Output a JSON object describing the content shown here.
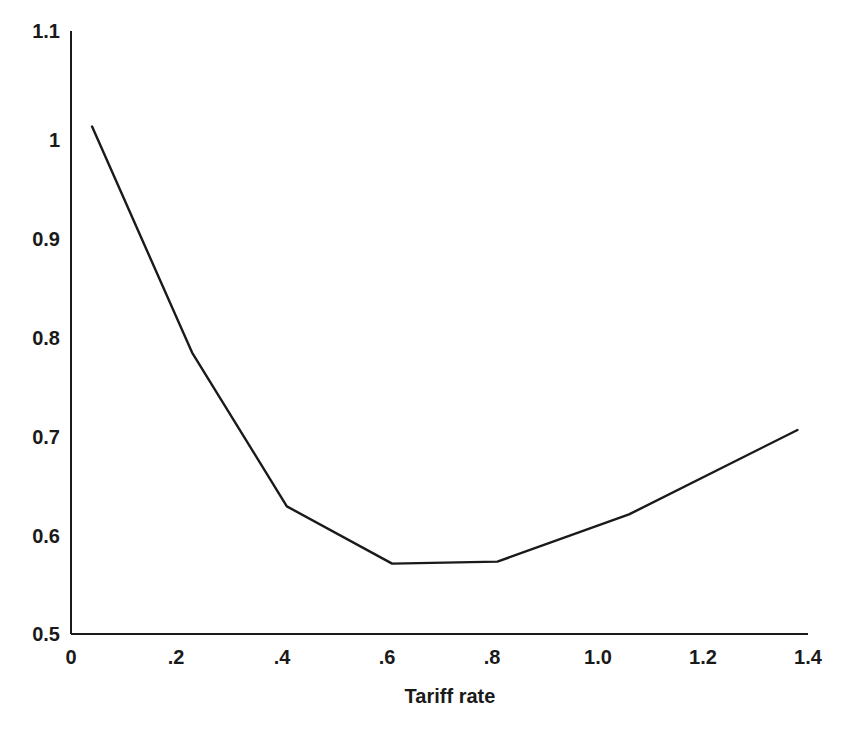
{
  "chart_data": {
    "type": "line",
    "title": "",
    "subtitle": "",
    "xlabel": "Tariff rate",
    "ylabel": "",
    "xlim": [
      0,
      1.4
    ],
    "ylim": [
      0.5,
      1.1
    ],
    "grid": false,
    "legend": null,
    "annotations": [],
    "x_ticks": [
      {
        "value": 0,
        "label": "0"
      },
      {
        "value": 0.2,
        "label": ".2"
      },
      {
        "value": 0.4,
        "label": ".4"
      },
      {
        "value": 0.6,
        "label": ".6"
      },
      {
        "value": 0.8,
        "label": ".8"
      },
      {
        "value": 1.0,
        "label": "1.0"
      },
      {
        "value": 1.2,
        "label": "1.2"
      },
      {
        "value": 1.4,
        "label": "1.4"
      }
    ],
    "y_ticks": [
      {
        "value": 1.1,
        "label": "1.1"
      },
      {
        "value": 1.0,
        "label": "1"
      },
      {
        "value": 0.9,
        "label": "0.9"
      },
      {
        "value": 0.8,
        "label": "0.8"
      },
      {
        "value": 0.7,
        "label": "0.7"
      },
      {
        "value": 0.6,
        "label": "0.6"
      },
      {
        "value": 0.5,
        "label": "0.5"
      }
    ],
    "series": [
      {
        "name": "welfare",
        "color": "#1a1a1a",
        "x": [
          0.04,
          0.23,
          0.41,
          0.61,
          0.81,
          1.06,
          1.38
        ],
        "values": [
          1.005,
          0.78,
          0.627,
          0.57,
          0.572,
          0.619,
          0.703
        ]
      }
    ]
  },
  "axis_style": {
    "line_color": "#1a1a1a",
    "line_width": 2,
    "background": "#ffffff"
  }
}
